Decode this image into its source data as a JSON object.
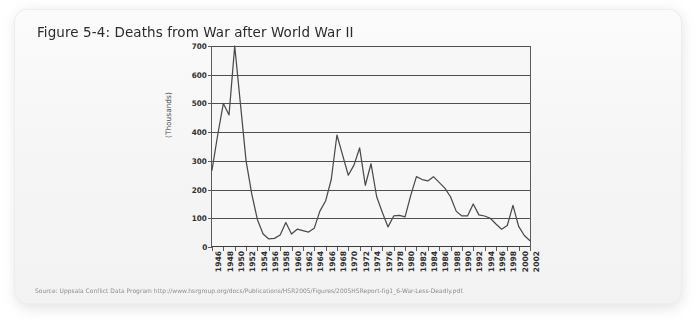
{
  "figure": {
    "title": "Figure 5-4: Deaths from War after World War II",
    "source": "Source: Uppsala Conflict Data Program http://www.hsrgroup.org/docs/Publications/HSR2005/Figures/2005HSReport-fig1_6-War-Less-Deadly.pdf."
  },
  "colors": {
    "card_background": "#f5f5f5",
    "plot_background": "#f7f7f7",
    "line": "#4a4a4a",
    "gridline": "#4f4f4f",
    "axis": "#3d3d3d",
    "title_text": "#2b2b2b",
    "source_text": "#8c8c8c",
    "tick_text": "#2e2e2e"
  },
  "chart_data": {
    "type": "line",
    "title": "Figure 5-4: Deaths from War after World War II",
    "xlabel": "",
    "ylabel": "(Thousands)",
    "ylim": [
      0,
      700
    ],
    "yticks": [
      0,
      100,
      200,
      300,
      400,
      500,
      600,
      700
    ],
    "ytick_labels": [
      "0",
      "100",
      "200",
      "300",
      "400",
      "500",
      "600",
      "700"
    ],
    "xlim": [
      1946,
      2002
    ],
    "xticks": [
      1946,
      1948,
      1950,
      1952,
      1954,
      1956,
      1958,
      1960,
      1962,
      1964,
      1966,
      1968,
      1970,
      1972,
      1974,
      1976,
      1978,
      1980,
      1982,
      1984,
      1986,
      1988,
      1990,
      1992,
      1994,
      1996,
      1998,
      2000,
      2002
    ],
    "xtick_labels": [
      "1946",
      "1948",
      "1950",
      "1952",
      "1954",
      "1956",
      "1958",
      "1960",
      "1962",
      "1964",
      "1966",
      "1968",
      "1970",
      "1972",
      "1974",
      "1976",
      "1978",
      "1980",
      "1982",
      "1984",
      "1986",
      "1988",
      "1990",
      "1992",
      "1994",
      "1996",
      "1998",
      "2000",
      "2002"
    ],
    "grid": true,
    "legend": false,
    "units": "thousands of battle deaths",
    "x": [
      1946,
      1947,
      1948,
      1949,
      1950,
      1951,
      1952,
      1953,
      1954,
      1955,
      1956,
      1957,
      1958,
      1959,
      1960,
      1961,
      1962,
      1963,
      1964,
      1965,
      1966,
      1967,
      1968,
      1969,
      1970,
      1971,
      1972,
      1973,
      1974,
      1975,
      1976,
      1977,
      1978,
      1979,
      1980,
      1981,
      1982,
      1983,
      1984,
      1985,
      1986,
      1987,
      1988,
      1989,
      1990,
      1991,
      1992,
      1993,
      1994,
      1995,
      1996,
      1997,
      1998,
      1999,
      2000,
      2001,
      2002
    ],
    "series": [
      {
        "name": "Battle deaths from war",
        "values": [
          268,
          390,
          500,
          460,
          700,
          500,
          300,
          185,
          95,
          45,
          28,
          30,
          42,
          85,
          45,
          62,
          57,
          52,
          65,
          125,
          160,
          235,
          390,
          320,
          250,
          285,
          345,
          215,
          290,
          175,
          120,
          70,
          108,
          110,
          105,
          180,
          245,
          235,
          230,
          245,
          225,
          205,
          175,
          125,
          108,
          108,
          150,
          112,
          108,
          100,
          80,
          62,
          75,
          145,
          72,
          40,
          22
        ]
      }
    ]
  }
}
